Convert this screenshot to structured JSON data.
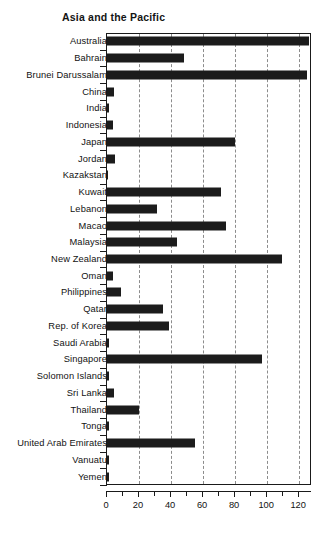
{
  "chart_data": {
    "type": "bar",
    "orientation": "horizontal",
    "title": "Asia and the Pacific",
    "xlabel": "",
    "ylabel": "",
    "xlim": [
      0,
      128
    ],
    "grid": true,
    "grid_axis": "x",
    "legend": null,
    "bar_color": "#1c1c1c",
    "axis_color": "#1a1a1a",
    "gridline_color": "#8c8c8c",
    "xticks": [
      0,
      20,
      40,
      60,
      80,
      100,
      120
    ],
    "xticklabels": [
      "0",
      "20",
      "40",
      "60",
      "80",
      "100",
      "120"
    ],
    "xticks_minor": [
      10,
      30,
      50,
      70,
      90,
      110
    ],
    "categories": [
      "Australia",
      "Bahrain",
      "Brunei Darussalam",
      "China",
      "India",
      "Indonesia",
      "Japan",
      "Jordan",
      "Kazakstan",
      "Kuwait",
      "Lebanon",
      "Macao",
      "Malaysia",
      "New Zealand",
      "Oman",
      "Philippines",
      "Qatar",
      "Rep. of Korea",
      "Saudi Arabia",
      "Singapore",
      "Solomon Islands",
      "Sri Lanka",
      "Thailand",
      "Tonga",
      "United Arab Emirates",
      "Vanuatu",
      "Yemen"
    ],
    "values": [
      126,
      48,
      125,
      4.5,
      1.5,
      3.5,
      80,
      5,
      0.8,
      71,
      31,
      74,
      44,
      109,
      4,
      9,
      35,
      39,
      1.2,
      97,
      1,
      4.5,
      20,
      1,
      55,
      1,
      1
    ]
  }
}
